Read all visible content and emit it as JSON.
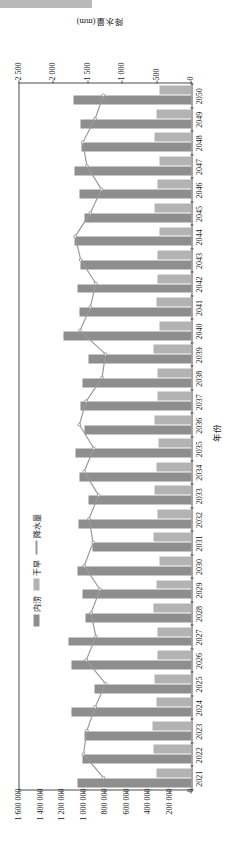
{
  "figure": {
    "x_axis_title": "年份",
    "y_axis_left_title": "人畜饮水量(m³/日)",
    "y_axis_right_title": "降水量(mm)",
    "left_ticks": [
      "1 600 000",
      "1 400 000",
      "1 200 000",
      "1 000 000",
      "800 000",
      "600 000",
      "400 000",
      "200 000",
      "0"
    ],
    "right_ticks": [
      "2 500",
      "2 000",
      "1 500",
      "1 000",
      "500",
      "0"
    ],
    "legend": [
      {
        "label": "内涝",
        "type": "bar",
        "color": "#8e8e8e"
      },
      {
        "label": "干旱",
        "type": "bar",
        "color": "#b3b3b3"
      },
      {
        "label": "降水量",
        "type": "line",
        "color": "#9a9a9a"
      }
    ]
  },
  "chart_data": {
    "type": "bar",
    "title": "",
    "xlabel": "年份",
    "ylabel": "人畜饮水量(m³/日)",
    "y2label": "降水量(mm)",
    "ylim": [
      0,
      1600000
    ],
    "y2lim": [
      0,
      2500
    ],
    "grid": false,
    "legend_position": "top-center",
    "categories": [
      "2021",
      "2022",
      "2023",
      "2024",
      "2025",
      "2026",
      "2027",
      "2028",
      "2029",
      "2030",
      "2031",
      "2032",
      "2033",
      "2034",
      "2035",
      "2036",
      "2037",
      "2038",
      "2039",
      "2040",
      "2041",
      "2042",
      "2043",
      "2044",
      "2045",
      "2046",
      "2047",
      "2048",
      "2049",
      "2050"
    ],
    "series": [
      {
        "name": "内涝",
        "axis": "left",
        "color": "#8e8e8e",
        "values": [
          1060000,
          1010000,
          1000000,
          1115000,
          900000,
          1120000,
          1145000,
          990000,
          1010000,
          1060000,
          920000,
          1055000,
          960000,
          1040000,
          1080000,
          1000000,
          1030000,
          1010000,
          960000,
          1195000,
          1040000,
          1060000,
          1030000,
          1090000,
          1000000,
          1040000,
          1090000,
          1020000,
          1035000,
          1095000
        ]
      },
      {
        "name": "干旱",
        "axis": "left",
        "color": "#b3b3b3",
        "values": [
          330000,
          350000,
          365000,
          330000,
          345000,
          320000,
          320000,
          350000,
          330000,
          300000,
          350000,
          320000,
          340000,
          330000,
          310000,
          345000,
          320000,
          315000,
          350000,
          300000,
          325000,
          320000,
          320000,
          300000,
          340000,
          320000,
          300000,
          345000,
          330000,
          300000
        ]
      },
      {
        "name": "降水量",
        "axis": "right",
        "color": "#9a9a9a",
        "values": [
          1280,
          1570,
          1520,
          1400,
          1250,
          1530,
          1390,
          1460,
          1330,
          1560,
          1430,
          1490,
          1350,
          1560,
          1420,
          1630,
          1530,
          1300,
          1250,
          1620,
          1470,
          1390,
          1610,
          1690,
          1470,
          1310,
          1520,
          1580,
          1400,
          1280
        ]
      }
    ]
  }
}
